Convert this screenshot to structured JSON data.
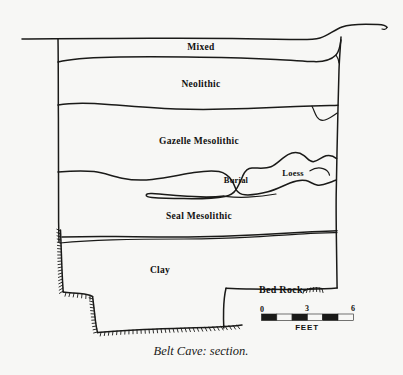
{
  "figure": {
    "caption": "Belt Cave: section.",
    "background_color": "#f7f7f5",
    "ink_color": "#1a1a18"
  },
  "layers": [
    {
      "id": "mixed",
      "label": "Mixed",
      "label_x": 201,
      "label_y": 48
    },
    {
      "id": "neolithic",
      "label": "Neolithic",
      "label_x": 201,
      "label_y": 85
    },
    {
      "id": "gazelle-mesolithic",
      "label": "Gazelle Mesolithic",
      "label_x": 199,
      "label_y": 142
    },
    {
      "id": "seal-mesolithic",
      "label": "Seal Mesolithic",
      "label_x": 199,
      "label_y": 217
    },
    {
      "id": "clay",
      "label": "Clay",
      "label_x": 160,
      "label_y": 271
    }
  ],
  "features": [
    {
      "id": "burial",
      "label": "Burial",
      "label_x": 236,
      "label_y": 181
    },
    {
      "id": "loess",
      "label": "Loess",
      "label_x": 293,
      "label_y": 174
    }
  ],
  "bedrock": {
    "label": "Bed Rock",
    "label_x": 259,
    "label_y": 291
  },
  "scale_bar": {
    "unit": "FEET",
    "ticks": [
      "0",
      "3",
      "6"
    ],
    "segments": 6,
    "min": 0,
    "max": 6
  }
}
